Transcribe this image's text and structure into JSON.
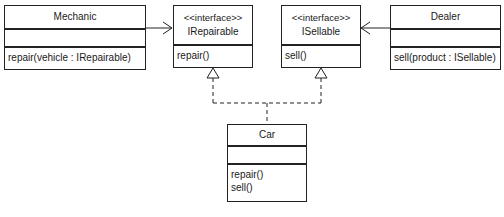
{
  "diagram": {
    "type": "UML class diagram",
    "classes": [
      {
        "id": "mechanic",
        "name": "Mechanic",
        "stereotype": null,
        "attributes": [],
        "operations": [
          "repair(vehicle : IRepairable)"
        ]
      },
      {
        "id": "irepairable",
        "name": "IRepairable",
        "stereotype": "<<interface>>",
        "operations": [
          "repair()"
        ]
      },
      {
        "id": "isellable",
        "name": "ISellable",
        "stereotype": "<<interface>>",
        "operations": [
          "sell()"
        ]
      },
      {
        "id": "dealer",
        "name": "Dealer",
        "stereotype": null,
        "attributes": [],
        "operations": [
          "sell(product : ISellable)"
        ]
      },
      {
        "id": "car",
        "name": "Car",
        "stereotype": null,
        "attributes": [],
        "operations": [
          "repair()",
          "sell()"
        ]
      }
    ],
    "relationships": [
      {
        "from": "Mechanic",
        "to": "IRepairable",
        "kind": "dependency-arrow"
      },
      {
        "from": "Dealer",
        "to": "ISellable",
        "kind": "dependency-arrow"
      },
      {
        "from": "Car",
        "to": "IRepairable",
        "kind": "realization"
      },
      {
        "from": "Car",
        "to": "ISellable",
        "kind": "realization"
      }
    ],
    "colors": {
      "line": "#222222",
      "background": "#ffffff"
    }
  }
}
